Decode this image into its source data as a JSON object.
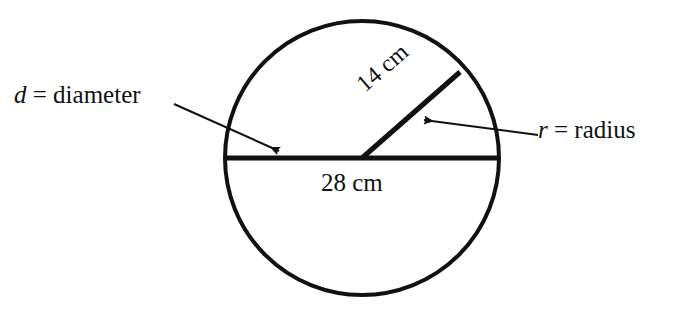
{
  "figure": {
    "background_color": "#ffffff",
    "stroke_color": "#111111",
    "text_color": "#111111"
  },
  "labels": {
    "diameter_variable": "d",
    "diameter_equals": " = diameter",
    "diameter_text": "d = diameter",
    "radius_variable": "r",
    "radius_equals": " = radius",
    "radius_text": "r = radius",
    "diameter_measure": "28 cm",
    "radius_measure": "14 cm"
  },
  "geometry": {
    "circle": {
      "center_x": 362,
      "center_y": 158,
      "radius": 137,
      "stroke_width": 4
    },
    "diameter_line": {
      "x1": 227,
      "y1": 158,
      "x2": 498,
      "y2": 158,
      "stroke_width": 5
    },
    "radius_line": {
      "x1": 362,
      "y1": 158,
      "x2": 460,
      "y2": 72,
      "stroke_width": 5
    },
    "diameter_leader": {
      "x1": 174,
      "y1": 104,
      "x2": 279,
      "y2": 151,
      "stroke_width": 2
    },
    "radius_leader": {
      "x1": 538,
      "y1": 135,
      "x2": 424,
      "y2": 120,
      "stroke_width": 2
    }
  },
  "measurements": {
    "diameter_value": 28,
    "radius_value": 14,
    "unit": "cm"
  }
}
